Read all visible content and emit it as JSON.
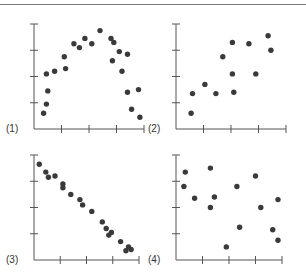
{
  "figure": {
    "panel_labels": [
      "(1)",
      "(2)",
      "(3)",
      "(4)"
    ]
  },
  "colors": {
    "axis": "#555555",
    "point": "#3a3a3a",
    "top_rule": "#7a7a7a"
  },
  "chart_data": [
    {
      "type": "scatter",
      "title": "(1)",
      "description": "Curvilinear (inverted U) relationship",
      "xlim": [
        0,
        4
      ],
      "ylim": [
        0,
        4
      ],
      "x_ticks": 4,
      "y_ticks": 3,
      "points": [
        [
          0.35,
          0.6
        ],
        [
          0.45,
          0.95
        ],
        [
          0.5,
          1.45
        ],
        [
          0.45,
          2.1
        ],
        [
          0.75,
          2.2
        ],
        [
          1.1,
          2.75
        ],
        [
          1.15,
          2.3
        ],
        [
          1.45,
          3.25
        ],
        [
          1.65,
          3.1
        ],
        [
          1.85,
          3.45
        ],
        [
          2.1,
          3.25
        ],
        [
          2.4,
          3.75
        ],
        [
          2.8,
          3.45
        ],
        [
          2.9,
          3.3
        ],
        [
          2.85,
          2.6
        ],
        [
          3.1,
          2.95
        ],
        [
          3.2,
          2.2
        ],
        [
          3.4,
          2.85
        ],
        [
          3.4,
          1.4
        ],
        [
          3.55,
          0.75
        ],
        [
          3.8,
          1.5
        ],
        [
          3.85,
          0.45
        ]
      ]
    },
    {
      "type": "scatter",
      "title": "(2)",
      "description": "Moderate positive correlation",
      "xlim": [
        0,
        4
      ],
      "ylim": [
        0,
        4
      ],
      "x_ticks": 4,
      "y_ticks": 3,
      "points": [
        [
          0.55,
          0.6
        ],
        [
          0.6,
          1.35
        ],
        [
          1.05,
          1.7
        ],
        [
          1.45,
          1.35
        ],
        [
          1.7,
          2.75
        ],
        [
          2.05,
          2.1
        ],
        [
          2.05,
          3.3
        ],
        [
          2.1,
          1.4
        ],
        [
          2.65,
          3.25
        ],
        [
          2.9,
          2.1
        ],
        [
          3.35,
          3.55
        ],
        [
          3.45,
          3.0
        ]
      ]
    },
    {
      "type": "scatter",
      "title": "(3)",
      "description": "Strong negative linear correlation",
      "xlim": [
        0,
        4
      ],
      "ylim": [
        0,
        4
      ],
      "x_ticks": 4,
      "y_ticks": 3,
      "points": [
        [
          0.2,
          3.65
        ],
        [
          0.45,
          3.35
        ],
        [
          0.55,
          3.15
        ],
        [
          0.8,
          3.2
        ],
        [
          1.1,
          2.9
        ],
        [
          1.1,
          2.75
        ],
        [
          1.4,
          2.5
        ],
        [
          1.75,
          2.3
        ],
        [
          1.85,
          2.1
        ],
        [
          2.2,
          1.85
        ],
        [
          2.6,
          1.45
        ],
        [
          2.75,
          1.2
        ],
        [
          2.85,
          0.95
        ],
        [
          2.95,
          1.05
        ],
        [
          3.3,
          0.7
        ],
        [
          3.5,
          0.35
        ],
        [
          3.6,
          0.5
        ],
        [
          3.7,
          0.4
        ]
      ]
    },
    {
      "type": "scatter",
      "title": "(4)",
      "description": "No correlation",
      "xlim": [
        0,
        4
      ],
      "ylim": [
        0,
        4
      ],
      "x_ticks": 4,
      "y_ticks": 3,
      "points": [
        [
          0.35,
          3.35
        ],
        [
          0.3,
          2.8
        ],
        [
          0.7,
          2.35
        ],
        [
          1.3,
          3.5
        ],
        [
          1.45,
          2.4
        ],
        [
          1.3,
          2.0
        ],
        [
          1.9,
          0.5
        ],
        [
          2.3,
          2.8
        ],
        [
          2.4,
          1.25
        ],
        [
          3.0,
          3.2
        ],
        [
          3.2,
          2.0
        ],
        [
          3.65,
          1.15
        ],
        [
          3.85,
          2.3
        ],
        [
          3.85,
          0.75
        ]
      ]
    }
  ]
}
